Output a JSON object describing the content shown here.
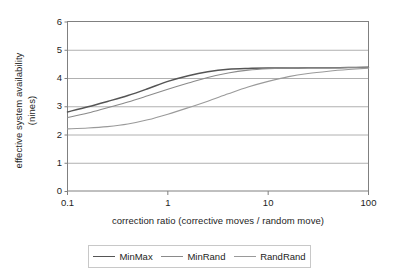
{
  "chart_data": {
    "type": "line",
    "title": "",
    "xlabel": "correction ratio (corrective moves / random move)",
    "ylabel": "effective system availability (nines)",
    "ylabel_line1": "effective system availability",
    "ylabel_line2": "(nines)",
    "xscale": "log",
    "xlim": [
      0.1,
      100
    ],
    "ylim": [
      0,
      6
    ],
    "xticks": [
      "0.1",
      "1",
      "10",
      "100"
    ],
    "yticks": [
      "0",
      "1",
      "2",
      "3",
      "4",
      "5",
      "6"
    ],
    "grid": "horizontal",
    "legend_position": "bottom",
    "x": [
      0.1,
      0.16,
      0.25,
      0.4,
      0.63,
      1,
      1.6,
      2.5,
      4,
      6.3,
      10,
      16,
      25,
      40,
      63,
      100
    ],
    "series": [
      {
        "name": "MinMax",
        "color": "#555555",
        "width": 1.5,
        "values": [
          2.8,
          2.98,
          3.17,
          3.38,
          3.62,
          3.88,
          4.08,
          4.22,
          4.31,
          4.34,
          4.35,
          4.35,
          4.36,
          4.36,
          4.37,
          4.38
        ]
      },
      {
        "name": "MinRand",
        "color": "#8a8a8a",
        "width": 1.1,
        "values": [
          2.6,
          2.76,
          2.95,
          3.15,
          3.37,
          3.6,
          3.82,
          4.02,
          4.18,
          4.28,
          4.33,
          4.35,
          4.36,
          4.36,
          4.37,
          4.38
        ]
      },
      {
        "name": "RandRand",
        "color": "#9a9a9a",
        "width": 1.1,
        "values": [
          2.2,
          2.23,
          2.28,
          2.37,
          2.52,
          2.72,
          2.95,
          3.18,
          3.44,
          3.68,
          3.88,
          4.05,
          4.16,
          4.24,
          4.3,
          4.35
        ]
      }
    ]
  },
  "legend": {
    "items": [
      {
        "label": "MinMax"
      },
      {
        "label": "MinRand"
      },
      {
        "label": "RandRand"
      }
    ]
  },
  "colors": {
    "plot_border": "#808080",
    "gridline": "#b0b0b0",
    "legend_border": "#c8c8c8",
    "text": "#1d1d1d"
  }
}
